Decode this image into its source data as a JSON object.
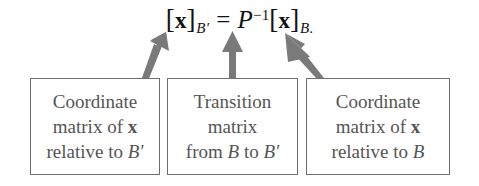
{
  "equation": {
    "left_bracket_open": "[",
    "left_vector": "x",
    "left_bracket_close": "]",
    "left_subscript": "B′",
    "equals": "=",
    "matrix_symbol": "P",
    "matrix_exponent": "−1",
    "right_bracket_open": "[",
    "right_vector": "x",
    "right_bracket_close": "]",
    "right_subscript": "B",
    "terminal_period": ".",
    "plain_text": "[x]_{B′} = P⁻¹[x]_{B}."
  },
  "boxes": [
    {
      "id": "coordinate-matrix-b-prime",
      "lines": [
        {
          "text": "Coordinate"
        },
        {
          "pre": "matrix of ",
          "bold": "x",
          "post": ""
        },
        {
          "pre": "relative to ",
          "italic": "B′",
          "post": ""
        }
      ],
      "plain_text": "Coordinate matrix of x relative to B′"
    },
    {
      "id": "transition-matrix",
      "lines": [
        {
          "text": "Transition"
        },
        {
          "text": "matrix"
        },
        {
          "pre": "from ",
          "italic": "B",
          "mid": " to ",
          "italic2": "B′",
          "post": ""
        }
      ],
      "plain_text": "Transition matrix from B to B′"
    },
    {
      "id": "coordinate-matrix-b",
      "lines": [
        {
          "text": "Coordinate"
        },
        {
          "pre": "matrix of ",
          "bold": "x",
          "post": ""
        },
        {
          "pre": "relative to ",
          "italic": "B",
          "post": ""
        }
      ],
      "plain_text": "Coordinate matrix of x relative to B"
    }
  ],
  "arrows": [
    {
      "id": "arrow-to-left-coordinate-matrix",
      "direction": "up-right-slant",
      "target": "[x]_{B′}"
    },
    {
      "id": "arrow-to-transition-matrix",
      "direction": "up-vertical",
      "target": "P⁻¹"
    },
    {
      "id": "arrow-to-right-coordinate-matrix",
      "direction": "up-left-slant",
      "target": "[x]_{B}"
    }
  ],
  "colors": {
    "background": "#ffffff",
    "equation_text": "#111111",
    "box_text": "#555555",
    "box_border": "#6e6e6e",
    "arrow_fill": "#7a7a7a"
  }
}
